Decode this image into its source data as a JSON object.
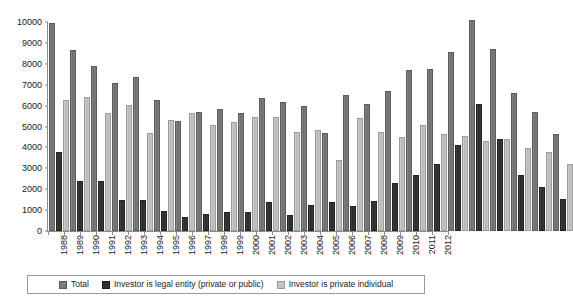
{
  "chart_data": {
    "type": "bar",
    "title": "",
    "subtitle": "",
    "xlabel": "",
    "ylabel": "",
    "ylim": [
      0,
      10000
    ],
    "ytick_step": 1000,
    "yticks": [
      "0",
      "1000",
      "2000",
      "3000",
      "4000",
      "5000",
      "6000",
      "7000",
      "8000",
      "9000",
      "10000"
    ],
    "grid": false,
    "legend_position": "bottom",
    "orientation": "vertical",
    "grouping": "grouped",
    "categories": [
      "1988",
      "1989",
      "1990",
      "1991",
      "1992",
      "1993",
      "1994",
      "1995",
      "1996",
      "1997",
      "1998",
      "1999",
      "2000",
      "2001",
      "2002",
      "2003",
      "2004",
      "2005",
      "2006",
      "2007",
      "2008",
      "2009",
      "2010",
      "2011",
      "2012"
    ],
    "series": [
      {
        "name": "Total",
        "color": "#7b7b7b",
        "values": [
          9850,
          8550,
          7800,
          7000,
          7250,
          6150,
          5150,
          5600,
          5750,
          5550,
          6250,
          6100,
          5900,
          4600,
          6400,
          6000,
          6600,
          7600,
          7650,
          8450,
          10000,
          8600,
          6500,
          5600,
          4550
        ]
      },
      {
        "name": "Investor is legal entity (private or public)",
        "color": "#2f2f2f",
        "values": [
          3700,
          2300,
          2300,
          1400,
          1400,
          850,
          580,
          720,
          820,
          820,
          1300,
          650,
          1150,
          1300,
          1100,
          1350,
          2200,
          2600,
          3100,
          4000,
          6000,
          4300,
          2600,
          2000,
          1450
        ]
      },
      {
        "name": "Investor is private individual",
        "color": "#c4c4c4",
        "values": [
          6150,
          6300,
          5550,
          5950,
          4600,
          5200,
          5550,
          5000,
          5100,
          5350,
          5350,
          4650,
          4750,
          3300,
          5300,
          4650,
          4400,
          5000,
          4550,
          4450,
          4200,
          4300,
          3900,
          3700,
          3100
        ]
      }
    ]
  },
  "legend": {
    "items": [
      {
        "label": "Total",
        "key": "total"
      },
      {
        "label": "Investor is legal entity (private or public)",
        "key": "legal"
      },
      {
        "label": "Investor is private individual",
        "key": "individual"
      }
    ]
  }
}
